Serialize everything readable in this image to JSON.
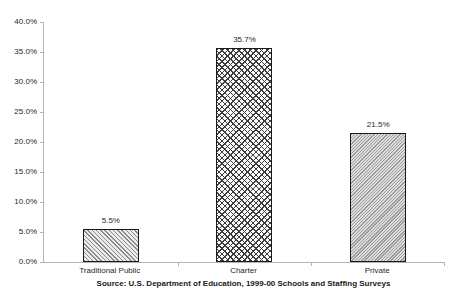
{
  "chart_data": {
    "type": "bar",
    "title": "",
    "xlabel": "",
    "ylabel": "",
    "categories": [
      "Traditional Public",
      "Charter",
      "Private"
    ],
    "values": [
      5.5,
      35.7,
      21.5
    ],
    "value_labels": [
      "5.5%",
      "35.7%",
      "21.5%"
    ],
    "bar_patterns": [
      "diagonal-hatch",
      "diagonal-crosshatch",
      "fine-diagonal-hatch"
    ],
    "ylim": [
      0,
      40
    ],
    "ytick_values": [
      0,
      5,
      10,
      15,
      20,
      25,
      30,
      35,
      40
    ],
    "ytick_labels": [
      "0.0%",
      "5.0%",
      "10.0%",
      "15.0%",
      "20.0%",
      "25.0%",
      "30.0%",
      "35.0%",
      "40.0%"
    ],
    "grid": false,
    "legend_position": "none",
    "source_note": "Source: U.S. Department of Education, 1999-00 Schools and Staffing Surveys",
    "colors": {
      "axis": "#b3b3b3",
      "bar_border": "#1a1a1a",
      "text": "#1f1f1f",
      "background": "#ffffff"
    }
  }
}
